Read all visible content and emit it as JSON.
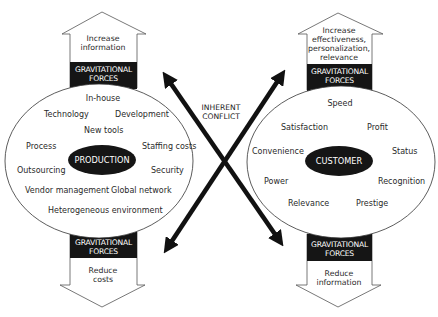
{
  "diagram": {
    "colors": {
      "ink": "#111111",
      "band": "#151515",
      "text": "#2a2a2a",
      "background": "#ffffff"
    },
    "conflict_label": {
      "line1": "INHERENT",
      "line2": "CONFLICT"
    },
    "production": {
      "core_label": "PRODUCTION",
      "top_arrow": {
        "line1": "Increase",
        "line2": "information",
        "band_line1": "GRAVITATIONAL",
        "band_line2": "FORCES"
      },
      "bottom_arrow": {
        "band_line1": "GRAVITATIONAL",
        "band_line2": "FORCES",
        "line1": "Reduce",
        "line2": "costs"
      },
      "items": [
        "In-house",
        "Technology",
        "Development",
        "New tools",
        "Process",
        "Staffing costs",
        "Outsourcing",
        "Security",
        "Vendor management",
        "Global network",
        "Heterogeneous environment"
      ]
    },
    "customer": {
      "core_label": "CUSTOMER",
      "top_arrow": {
        "line1": "Increase",
        "line2": "effectiveness,",
        "line3": "personalization,",
        "line4": "relevance",
        "band_line1": "GRAVITATIONAL",
        "band_line2": "FORCES"
      },
      "bottom_arrow": {
        "band_line1": "GRAVITATIONAL",
        "band_line2": "FORCES",
        "line1": "Reduce",
        "line2": "information"
      },
      "items": [
        "Speed",
        "Satisfaction",
        "Profit",
        "Convenience",
        "Status",
        "Power",
        "Recognition",
        "Relevance",
        "Prestige"
      ]
    }
  }
}
